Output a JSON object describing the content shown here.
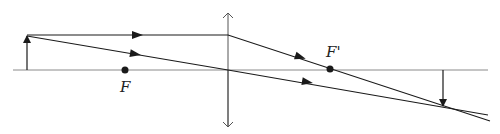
{
  "diagram": {
    "type": "ray-diagram-converging-lens",
    "colors": {
      "background": "#ffffff",
      "line": "#1a1a1a",
      "axis": "#8a8a8a"
    },
    "labels": {
      "front_focal": "F",
      "back_focal": "F'"
    },
    "geometry": {
      "axis": {
        "x1": 13,
        "x2": 488,
        "y": 70
      },
      "lens": {
        "x": 228,
        "y_top": 13,
        "y_bottom": 127
      },
      "object": {
        "x": 27,
        "y_base": 70,
        "y_tip": 35
      },
      "image": {
        "x": 443,
        "y_base": 70,
        "y_tip": 107
      },
      "front_focal_point": {
        "x": 125,
        "y": 70
      },
      "back_focal_point": {
        "x": 330,
        "y": 69
      }
    },
    "rays": [
      {
        "name": "parallel-ray",
        "points": [
          [
            27,
            35
          ],
          [
            228,
            35
          ],
          [
            490,
            121
          ]
        ]
      },
      {
        "name": "central-ray",
        "points": [
          [
            27,
            36
          ],
          [
            228,
            70
          ],
          [
            488,
            115
          ]
        ]
      }
    ]
  }
}
